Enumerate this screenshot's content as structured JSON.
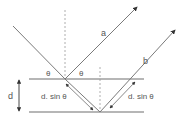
{
  "diagram": {
    "type": "bragg-diffraction",
    "labels": {
      "ray_a": "a",
      "ray_b": "b",
      "theta_left": "θ",
      "theta_right": "θ",
      "spacing": "d",
      "path_left": "d. sin θ",
      "path_right": "d. sin θ"
    },
    "colors": {
      "line": "#7a7a7a",
      "plane": "#6e6e6e",
      "dashed": "#9a9a9a",
      "arrow": "#333333",
      "text": "#555555"
    }
  }
}
